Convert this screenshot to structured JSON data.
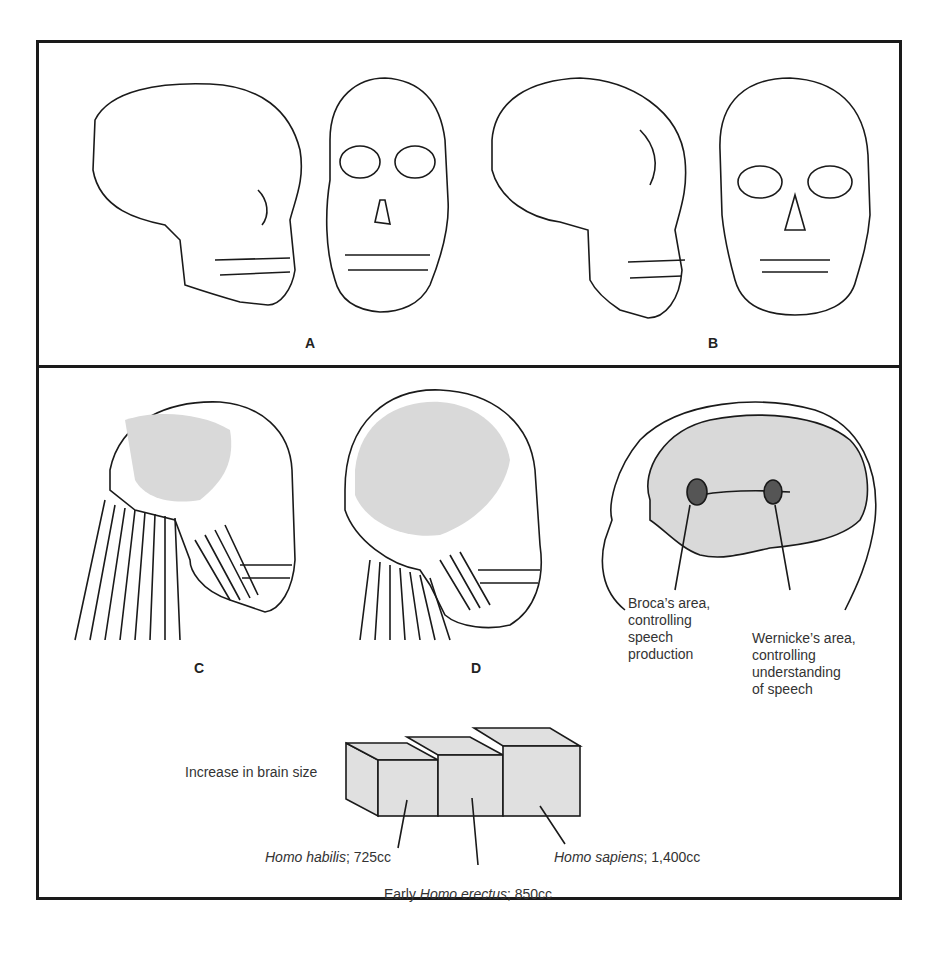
{
  "figure": {
    "panels": {
      "A": {
        "label": "A",
        "description": "Homo erectus skull, side and front views"
      },
      "B": {
        "label": "B",
        "description": "Modern human skull, side and front views"
      },
      "C": {
        "label": "C",
        "description": "Neck and jaw muscles, Homo erectus"
      },
      "D": {
        "label": "D",
        "description": "Neck and jaw muscles, modern human"
      }
    },
    "brain_areas": {
      "broca": [
        "Broca’s area,",
        "controlling",
        "speech",
        "production"
      ],
      "wernicke": [
        "Wernicke’s area,",
        "controlling",
        "understanding",
        "of speech"
      ]
    },
    "brain_size": {
      "title": "Increase in brain size",
      "habilis": {
        "species": "Homo habilis",
        "value": "; 725cc"
      },
      "erectus": {
        "prefix": "Early ",
        "species": "Homo erectus",
        "value": "; 850cc"
      },
      "sapiens": {
        "species": "Homo sapiens",
        "value": "; 1,400cc"
      }
    },
    "colors": {
      "line": "#1a1a1a",
      "shade": "#d9d9d9",
      "background": "#ffffff"
    }
  }
}
